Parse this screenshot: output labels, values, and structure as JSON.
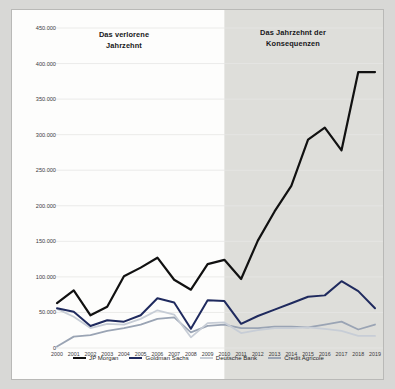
{
  "chart_data": {
    "type": "line",
    "title": "",
    "subtitle": "",
    "xlabel": "",
    "ylabel": "",
    "x": [
      2000,
      2001,
      2002,
      2003,
      2004,
      2005,
      2006,
      2007,
      2008,
      2009,
      2010,
      2011,
      2012,
      2013,
      2014,
      2015,
      2016,
      2017,
      2018,
      2019
    ],
    "categories": [
      "2000",
      "2001",
      "2002",
      "2003",
      "2004",
      "2005",
      "2006",
      "2007",
      "2008",
      "2009",
      "2010",
      "2011",
      "2012",
      "2013",
      "2014",
      "2015",
      "2016",
      "2017",
      "2018",
      "2019"
    ],
    "ylim": [
      0,
      450000
    ],
    "ytick_values": [
      0,
      50000,
      100000,
      150000,
      200000,
      250000,
      300000,
      350000,
      400000,
      450000
    ],
    "ytick_labels": [
      "0",
      "50.000",
      "100.000",
      "150.000",
      "200.000",
      "250.000",
      "300.000",
      "350.000",
      "400.000",
      "450.000"
    ],
    "grid": true,
    "legend_position": "bottom",
    "series": [
      {
        "name": "JP Morgan",
        "color": "#111111",
        "width": 2.2,
        "values": [
          63000,
          81000,
          46000,
          58000,
          101000,
          113000,
          127000,
          96000,
          82000,
          118000,
          124000,
          97000,
          151000,
          192000,
          228000,
          293000,
          310000,
          278000,
          388000,
          388000
        ]
      },
      {
        "name": "Goldman Sachs",
        "color": "#1f2a5e",
        "width": 2.0,
        "values": [
          56000,
          51000,
          31000,
          39000,
          37000,
          46000,
          70000,
          64000,
          27000,
          67000,
          66000,
          34000,
          45000,
          54000,
          63000,
          72000,
          74000,
          94000,
          80000,
          56000
        ]
      },
      {
        "name": "Deutsche Bank",
        "color": "#c7cdd6",
        "width": 1.8,
        "values": [
          55000,
          44000,
          28000,
          34000,
          33000,
          41000,
          53000,
          47000,
          15000,
          35000,
          36000,
          21000,
          25000,
          28000,
          28000,
          29000,
          27000,
          24000,
          17000,
          17000
        ]
      },
      {
        "name": "Credit Agricole",
        "color": "#9aa4b4",
        "width": 1.8,
        "values": [
          2000,
          16000,
          18000,
          24000,
          28000,
          33000,
          41000,
          43000,
          22000,
          31000,
          33000,
          28000,
          28000,
          30000,
          30000,
          29000,
          33000,
          37000,
          26000,
          33000
        ]
      }
    ],
    "annotations": [
      {
        "id": "lost-decade",
        "text": "Das verlorene\nJahrzehnt",
        "x_start": 2000,
        "x_end": 2009,
        "shaded": false
      },
      {
        "id": "consequences-decade",
        "text": "Das Jahrzehnt der\nKonsequenzen",
        "x_start": 2010,
        "x_end": 2019,
        "shaded": true,
        "shade_color": "#dededa"
      }
    ]
  },
  "legend": {
    "items": [
      {
        "label": "JP Morgan",
        "color": "#111111"
      },
      {
        "label": "Goldman Sachs",
        "color": "#1f2a5e"
      },
      {
        "label": "Deutsche Bank",
        "color": "#c7cdd6"
      },
      {
        "label": "Credit Agricole",
        "color": "#9aa4b4"
      }
    ]
  },
  "colors": {
    "page_background": "#d8d8d6",
    "card_background": "#fdfdfc",
    "card_border": "#b9b9b7",
    "gridline": "#e6e6e4",
    "shaded_band": "#dededa",
    "tick_text": "#3a3a3c",
    "annotation_text": "#18181a"
  }
}
